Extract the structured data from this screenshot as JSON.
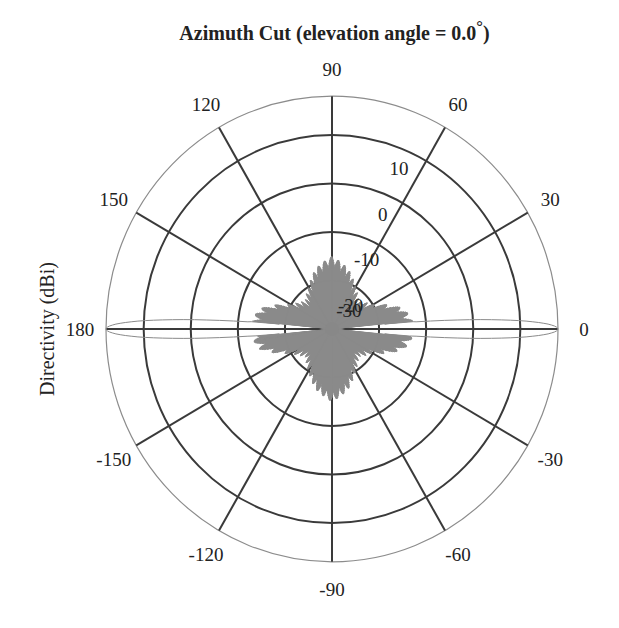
{
  "chart_data": {
    "type": "polar-line",
    "title": "Azimuth Cut (elevation angle = 0.0°)",
    "title_text": "Azimuth Cut (elevation angle = 0.0",
    "title_degree": "°",
    "title_close": ")",
    "ylabel": "Directivity (dBi)",
    "xlabel": "",
    "angle_ticks_deg": [
      90,
      60,
      30,
      0,
      -30,
      -60,
      -90,
      -120,
      -150,
      180,
      150,
      120
    ],
    "angle_tick_labels": [
      "90",
      "60",
      "30",
      "0",
      "-30",
      "-60",
      "-90",
      "-120",
      "-150",
      "180",
      "150",
      "120"
    ],
    "radial_ticks_db": [
      10,
      0,
      -10,
      -20,
      -30
    ],
    "radial_tick_labels": [
      "10",
      "0",
      "-10",
      "-20",
      "-30"
    ],
    "rlim_db": [
      -30,
      18
    ],
    "grid": true,
    "series": [
      {
        "name": "Directivity",
        "color": "#8a8a8a",
        "description": "Two narrow main beams at 0° and 180° peaking ~18 dBi; dense comb of sidelobes between about -25 and -12 dBi, highest (~-15 dBi) near ±90°",
        "main_beams": [
          {
            "angle_deg": 0,
            "peak_dbi": 18,
            "beamwidth_deg": 3
          },
          {
            "angle_deg": 180,
            "peak_dbi": 18,
            "beamwidth_deg": 3
          }
        ],
        "sidelobe_envelope": [
          {
            "angle_deg": 0,
            "level_dbi": -12
          },
          {
            "angle_deg": 15,
            "level_dbi": -14
          },
          {
            "angle_deg": 30,
            "level_dbi": -20
          },
          {
            "angle_deg": 45,
            "level_dbi": -22
          },
          {
            "angle_deg": 60,
            "level_dbi": -20
          },
          {
            "angle_deg": 75,
            "level_dbi": -17
          },
          {
            "angle_deg": 90,
            "level_dbi": -15
          },
          {
            "angle_deg": 105,
            "level_dbi": -17
          },
          {
            "angle_deg": 120,
            "level_dbi": -20
          },
          {
            "angle_deg": 135,
            "level_dbi": -22
          },
          {
            "angle_deg": 150,
            "level_dbi": -20
          },
          {
            "angle_deg": 165,
            "level_dbi": -14
          },
          {
            "angle_deg": 180,
            "level_dbi": -12
          }
        ]
      }
    ]
  },
  "colors": {
    "grid": "#3a3a3a",
    "outer_circle": "#8c8c8c",
    "pattern": "#8a8a8a",
    "text": "#222222"
  }
}
